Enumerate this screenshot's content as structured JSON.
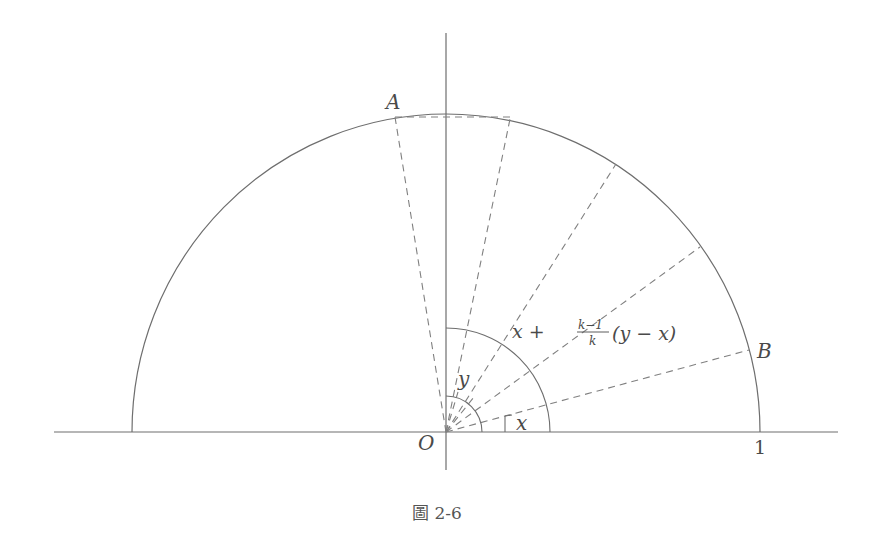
{
  "figure": {
    "caption": "圖 2-6",
    "labels": {
      "A": "A",
      "B": "B",
      "O": "O",
      "one": "1",
      "x": "x",
      "y": "y",
      "formula_prefix": "x +",
      "formula_num": "k−1",
      "formula_den": "k",
      "formula_suffix": "(y − x)"
    },
    "colors": {
      "line": "#6e6e6e",
      "dashed": "#808080",
      "text": "#4a4a4a"
    }
  }
}
